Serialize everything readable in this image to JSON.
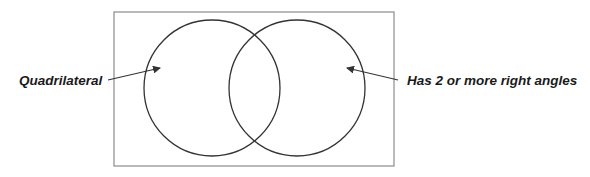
{
  "diagram": {
    "type": "venn",
    "universe": {
      "x": 114,
      "y": 12,
      "width": 280,
      "height": 154,
      "stroke": "#8c8c8c"
    },
    "sets": [
      {
        "id": "left",
        "label": "Quadrilateral",
        "cx": 212,
        "cy": 88,
        "r": 68,
        "stroke": "#333333",
        "arrow": {
          "x1": 108,
          "y1": 80,
          "x2": 160,
          "y2": 68
        }
      },
      {
        "id": "right",
        "label": "Has 2 or more right angles",
        "cx": 297,
        "cy": 88,
        "r": 68,
        "stroke": "#333333",
        "arrow": {
          "x1": 398,
          "y1": 80,
          "x2": 347,
          "y2": 68
        }
      }
    ],
    "arrow_color": "#333333",
    "text_color": "#1a1a1a"
  }
}
